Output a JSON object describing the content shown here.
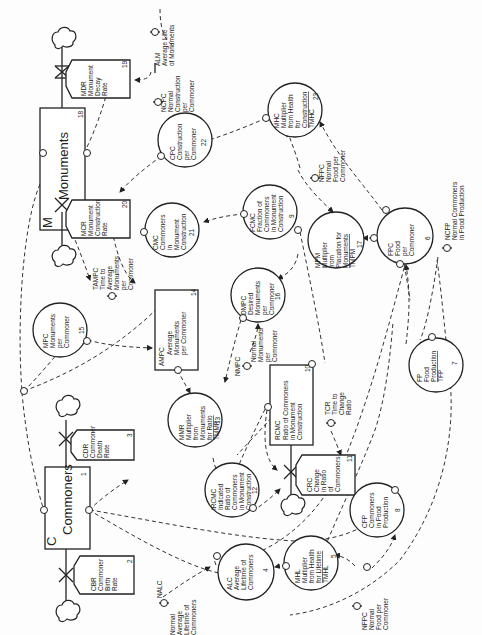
{
  "diagram": {
    "orientation": "rotated 90 degrees counter-clockwise",
    "levels": [
      {
        "code": "M",
        "name": "Monuments",
        "number": "18"
      },
      {
        "code": "C",
        "name": "Commoners",
        "number": "1"
      }
    ],
    "rates": [
      {
        "code": "MDR",
        "lines": [
          "MDR",
          "Monument",
          "Decay",
          "Rate"
        ],
        "number": "19"
      },
      {
        "code": "MCR",
        "lines": [
          "MCR",
          "Monument",
          "Construction",
          "Rate"
        ],
        "number": "20"
      },
      {
        "code": "CDR",
        "lines": [
          "CDR",
          "Commoner",
          "Death",
          "Rate"
        ],
        "number": "3"
      },
      {
        "code": "CBR",
        "lines": [
          "CBR",
          "Commoner",
          "Birth",
          "Rate"
        ],
        "number": "2"
      },
      {
        "code": "CRC",
        "lines": [
          "CRC",
          "Change",
          "in Ratio",
          "of",
          "Commoners"
        ],
        "number": "11"
      }
    ],
    "boxes": [
      {
        "code": "AMPC",
        "lines": [
          "AMPC",
          "Average",
          "Monuments",
          "per Commoner"
        ],
        "number": "14"
      },
      {
        "code": "RCMC",
        "lines": [
          "RCMC",
          "Ratio of Commoners",
          "in Monument",
          "Construction"
        ],
        "number": "10"
      }
    ],
    "auxiliaries": [
      {
        "code": "CPC",
        "lines": [
          "CPC",
          "Construction",
          "per",
          "Commoner"
        ],
        "number": "22"
      },
      {
        "code": "MHC",
        "lines": [
          "MHC",
          "Multiplier",
          "from Health",
          "for",
          "Construction"
        ],
        "table": "TMHC",
        "number": "23"
      },
      {
        "code": "CMC",
        "lines": [
          "CMC",
          "Commoners",
          "in",
          "Monument",
          "Construction"
        ],
        "number": "21"
      },
      {
        "code": "FCMC",
        "lines": [
          "FCMC",
          "Fraction of",
          "Commoners",
          "in Monument",
          "Construction"
        ],
        "number": "9"
      },
      {
        "code": "MPM",
        "lines": [
          "MPM",
          "Multiplier",
          "from",
          "Placation for",
          "Monuments"
        ],
        "table": "TMPM",
        "number": "17"
      },
      {
        "code": "FPC",
        "lines": [
          "FPC",
          "Food",
          "per",
          "Commoner"
        ],
        "number": "6"
      },
      {
        "code": "MPC",
        "lines": [
          "MPC",
          "Monuments",
          "per",
          "Commoner"
        ],
        "number": "15"
      },
      {
        "code": "DMPC",
        "lines": [
          "DMPC",
          "Desired",
          "Monuments",
          "per",
          "Commoner"
        ],
        "number": "16"
      },
      {
        "code": "MMR",
        "lines": [
          "MMR",
          "Multiplier",
          "from",
          "Monuments",
          "for Ratio"
        ],
        "table": "TMMR",
        "number": "13"
      },
      {
        "code": "FP",
        "lines": [
          "FP",
          "Food",
          "Production"
        ],
        "table": "TFP",
        "number": "7"
      },
      {
        "code": "IRCMC",
        "lines": [
          "IRCMC",
          "Indicated",
          "Ratio of",
          "Commoners",
          "in Monument",
          "Construction"
        ],
        "number": "12"
      },
      {
        "code": "ALC",
        "lines": [
          "ALC",
          "Average",
          "Lifetime of",
          "Commoners"
        ],
        "number": "4"
      },
      {
        "code": "MHL",
        "lines": [
          "MHL",
          "Multiplier",
          "from Health",
          "for Lifetime"
        ],
        "table": "TMHL",
        "number": "5"
      },
      {
        "code": "CFP",
        "lines": [
          "CFP",
          "Commoners",
          "in Food",
          "Production"
        ],
        "number": "8"
      }
    ],
    "constants": [
      {
        "code": "ALM",
        "lines": [
          "ALM",
          "Average Life",
          "of Monuments"
        ]
      },
      {
        "code": "NCPC",
        "lines": [
          "NCPC",
          "Normal",
          "Construction",
          "per",
          "Commoner"
        ]
      },
      {
        "code": "NFPC_top",
        "lines": [
          "NFPC",
          "Normal",
          "Food per",
          "Commoner"
        ]
      },
      {
        "code": "NCFP",
        "lines": [
          "NCFP",
          "Normal Commoners",
          "in Food Production"
        ]
      },
      {
        "code": "TAMPC",
        "lines": [
          "TAMPC",
          "Time to",
          "Average",
          "Monuments",
          "per",
          "Commoner"
        ]
      },
      {
        "code": "NMPC",
        "lines": [
          "NMPC",
          "Normal",
          "Monuments",
          "per",
          "Commoner"
        ]
      },
      {
        "code": "TCR",
        "lines": [
          "TCR",
          "Time to",
          "Change",
          "Ratio"
        ]
      },
      {
        "code": "NALC",
        "lines": [
          "NALC",
          "Normal",
          "Average",
          "Lifetime of",
          "Commoners"
        ]
      },
      {
        "code": "NFPC_bottom",
        "lines": [
          "NFPC",
          "Normal",
          "Food per",
          "Commoner"
        ]
      }
    ]
  }
}
